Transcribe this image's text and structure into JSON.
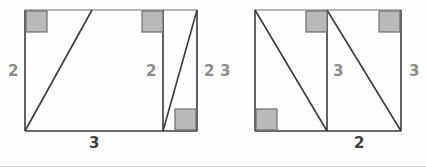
{
  "figure": {
    "stroke_color": "#3a3a3a",
    "marker_fill": "#b9b9b9",
    "marker_stroke": "#6e6e6e",
    "label_color": "#8c8c8c",
    "label_color_dark": "#3d3d3d",
    "background": "#ffffff",
    "divider_color": "#cfcfcf"
  },
  "left_figure": {
    "name": "trapezoid-with-triangles",
    "labels": {
      "left_side": "2",
      "inner_vertical": "2",
      "bottom_base": "3"
    },
    "right_angle_markers": 3
  },
  "right_figure": {
    "name": "parallelogram-with-triangles",
    "labels": {
      "left_side": "3",
      "inner_vertical": "3",
      "right_side": "3",
      "bottom_base": "2"
    },
    "right_angle_markers": 3
  },
  "shared_labels": {
    "between_figures_left": "2",
    "between_figures_right": "3"
  }
}
